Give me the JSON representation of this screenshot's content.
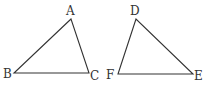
{
  "diagram": {
    "triangles": [
      {
        "name": "ABC",
        "vertices": [
          {
            "label": "A",
            "x": 71,
            "y": 19,
            "lx": 66,
            "ly": 15
          },
          {
            "label": "B",
            "x": 14,
            "y": 73,
            "lx": 3,
            "ly": 78
          },
          {
            "label": "C",
            "x": 89,
            "y": 73,
            "lx": 90,
            "ly": 80
          }
        ]
      },
      {
        "name": "DEF",
        "vertices": [
          {
            "label": "D",
            "x": 136,
            "y": 19,
            "lx": 130,
            "ly": 15
          },
          {
            "label": "F",
            "x": 118,
            "y": 74,
            "lx": 106,
            "ly": 79
          },
          {
            "label": "E",
            "x": 193,
            "y": 74,
            "lx": 194,
            "ly": 80
          }
        ]
      }
    ],
    "stroke_color": "#333333"
  }
}
